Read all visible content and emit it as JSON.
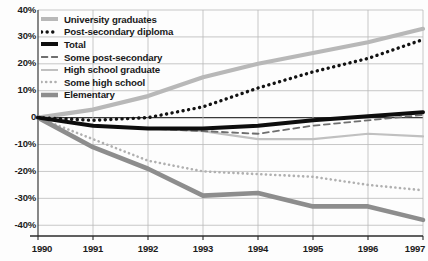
{
  "chart_data": {
    "type": "line",
    "title": "",
    "xlabel": "",
    "ylabel": "",
    "x": [
      1990,
      1991,
      1992,
      1993,
      1994,
      1995,
      1996,
      1997
    ],
    "xtick_labels": [
      "1990",
      "1991",
      "1992",
      "1993",
      "1994",
      "1995",
      "1996",
      "1997"
    ],
    "ytick_labels": [
      "40%",
      "30%",
      "20%",
      "10%",
      "0",
      "-10%",
      "-20%",
      "-30%",
      "-40%"
    ],
    "ytick_values": [
      40,
      30,
      20,
      10,
      0,
      -10,
      -20,
      -30,
      -40
    ],
    "ylim": [
      -44,
      40
    ],
    "xlim": [
      1990,
      1997
    ],
    "grid": true,
    "legend_position": "top-left",
    "zero_line": 0,
    "series": [
      {
        "name": "University graduates",
        "key": "university-graduates",
        "color": "#b8b8b8",
        "style": "solid",
        "width": 4.2,
        "values": [
          0,
          3,
          8,
          15,
          20,
          24,
          28,
          33
        ]
      },
      {
        "name": "Post-secondary diploma",
        "key": "post-secondary-diploma",
        "color": "#121212",
        "style": "dotted",
        "width": 3.4,
        "values": [
          0,
          -1,
          0,
          4,
          11,
          17,
          22,
          29
        ]
      },
      {
        "name": "Total",
        "key": "total",
        "color": "#0d0d0d",
        "style": "solid",
        "width": 4.0,
        "values": [
          0,
          -3,
          -4,
          -4,
          -3,
          -1,
          0.5,
          2
        ]
      },
      {
        "name": "Some post-secondary",
        "key": "some-post-secondary",
        "color": "#6e6e6e",
        "style": "dashed",
        "width": 1.8,
        "values": [
          0,
          -3,
          -4,
          -5,
          -6,
          -3,
          -1,
          1
        ]
      },
      {
        "name": "High school graduate",
        "key": "high-school-graduate",
        "color": "#c0c0c0",
        "style": "solid",
        "width": 2.2,
        "values": [
          0,
          -3,
          -4,
          -5,
          -8,
          -8,
          -6,
          -7
        ]
      },
      {
        "name": "Some high school",
        "key": "some-high-school",
        "color": "#b0b0b0",
        "style": "fine-dotted",
        "width": 2.6,
        "values": [
          0,
          -8,
          -16,
          -20,
          -21,
          -22,
          -25,
          -27
        ]
      },
      {
        "name": "Elementary",
        "key": "elementary",
        "color": "#8d8d8d",
        "style": "solid",
        "width": 4.6,
        "values": [
          0,
          -11,
          -19,
          -29,
          -28,
          -33,
          -33,
          -38
        ]
      }
    ]
  },
  "legend": {
    "items": [
      {
        "label": "University graduates"
      },
      {
        "label": "Post-secondary diploma"
      },
      {
        "label": "Total"
      },
      {
        "label": "Some post-secondary"
      },
      {
        "label": "High school graduate"
      },
      {
        "label": "Some high school"
      },
      {
        "label": "Elementary"
      }
    ]
  },
  "axes": {
    "y_labels": [
      "40%",
      "30%",
      "20%",
      "10%",
      "0",
      "-10%",
      "-20%",
      "-30%",
      "-40%"
    ],
    "x_labels": [
      "1990",
      "1991",
      "1992",
      "1993",
      "1994",
      "1995",
      "1996",
      "1997"
    ]
  },
  "colors": {
    "grid": "#b9b9b9",
    "axis": "#3a3a3a",
    "text": "#1a1a1a",
    "background": "#fdfdfd"
  }
}
